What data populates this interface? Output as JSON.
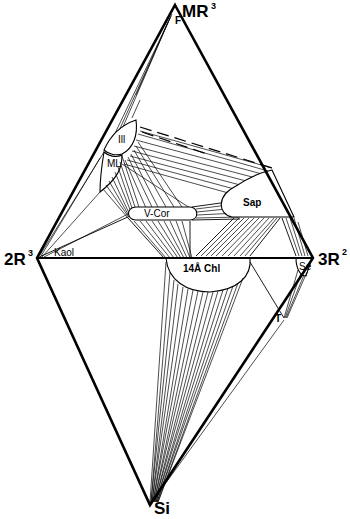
{
  "diagram": {
    "type": "rhombus phase diagram (clay mineral compositional space)",
    "vertices": {
      "top": {
        "label": "MR",
        "sup": "3"
      },
      "left": {
        "label": "2R",
        "sup": "3"
      },
      "right": {
        "label": "3R",
        "sup": "2"
      },
      "bottom": {
        "label": "Si",
        "sup": ""
      }
    },
    "phases": {
      "F": "F",
      "illite": "Ill",
      "mixed_layer": "ML",
      "kaolinite": "Kaol",
      "vermiculite_corrensite": "V-Cor",
      "saponite": "Sap",
      "chlorite": "14Å Chl",
      "sepiolite": "Se",
      "talc": "T"
    },
    "colors": {
      "line": "#000000",
      "background": "#ffffff"
    }
  }
}
